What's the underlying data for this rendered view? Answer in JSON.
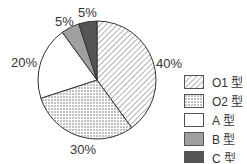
{
  "chart_data": {
    "type": "pie",
    "title": "",
    "categories": [
      "O1 型",
      "O2 型",
      "A 型",
      "B 型",
      "C 型"
    ],
    "values": [
      40,
      30,
      20,
      5,
      5
    ],
    "labels": [
      "40%",
      "30%",
      "20%",
      "5%",
      "5%"
    ],
    "fills": [
      "diagonal-hatch",
      "dotted",
      "white",
      "#a0a0a0",
      "#555555"
    ],
    "legend_position": "right"
  },
  "legend": {
    "items": [
      {
        "label": "O1 型"
      },
      {
        "label": "O2 型"
      },
      {
        "label": "A 型"
      },
      {
        "label": "B 型"
      },
      {
        "label": "C 型"
      }
    ]
  }
}
